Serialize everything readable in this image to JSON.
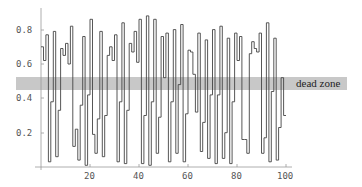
{
  "chart_data": {
    "type": "line",
    "style": "step",
    "title": "",
    "xlabel": "",
    "ylabel": "",
    "xlim": [
      0,
      100
    ],
    "ylim": [
      0,
      0.9
    ],
    "grid": false,
    "legend": null,
    "x_ticks": [
      20,
      40,
      60,
      80,
      100
    ],
    "y_ticks": [
      0.2,
      0.4,
      0.6,
      0.8
    ],
    "x_tick_labels": [
      "20",
      "40",
      "60",
      "80",
      "100"
    ],
    "y_tick_labels": [
      "0.2",
      "0.4",
      "0.6",
      "0.8"
    ],
    "band": {
      "label": "dead zone",
      "y_min": 0.45,
      "y_max": 0.52,
      "color": "#c8c8c8"
    },
    "series": [
      {
        "name": "signal",
        "color": "#444444",
        "values": [
          0.7,
          0.62,
          0.77,
          0.03,
          0.38,
          0.79,
          0.06,
          0.33,
          0.69,
          0.65,
          0.72,
          0.6,
          0.82,
          0.12,
          0.22,
          0.04,
          0.36,
          0.76,
          0.01,
          0.42,
          0.86,
          0.19,
          0.08,
          0.28,
          0.79,
          0.06,
          0.3,
          0.65,
          0.7,
          0.62,
          0.77,
          0.03,
          0.38,
          0.84,
          0.02,
          0.33,
          0.72,
          0.67,
          0.79,
          0.61,
          0.86,
          0.02,
          0.3,
          0.88,
          0.01,
          0.38,
          0.86,
          0.08,
          0.29,
          0.76,
          0.52,
          0.78,
          0.03,
          0.38,
          0.8,
          0.08,
          0.48,
          0.83,
          0.03,
          0.31,
          0.68,
          0.67,
          0.54,
          0.32,
          0.78,
          0.09,
          0.26,
          0.74,
          0.05,
          0.42,
          0.8,
          0.02,
          0.42,
          0.82,
          0.05,
          0.2,
          0.75,
          0.02,
          0.38,
          0.78,
          0.62,
          0.76,
          0.16,
          0.16,
          0.08,
          0.66,
          0.73,
          0.69,
          0.67,
          0.78,
          0.08,
          0.17,
          0.84,
          0.03,
          0.44,
          0.75,
          0.04,
          0.23,
          0.52,
          0.3
        ]
      }
    ]
  },
  "labels": {
    "band": "dead zone",
    "x_ticks": [
      "20",
      "40",
      "60",
      "80",
      "100"
    ],
    "y_ticks": [
      "0.2",
      "0.4",
      "0.6",
      "0.8"
    ]
  }
}
